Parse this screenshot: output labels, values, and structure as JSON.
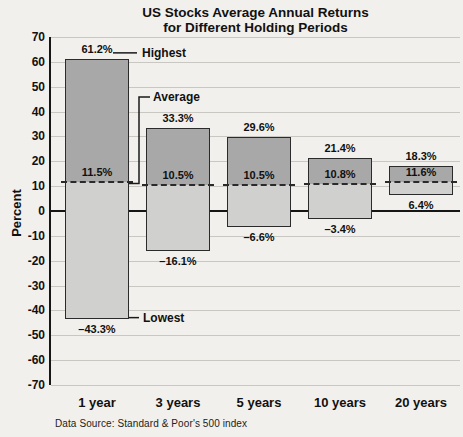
{
  "title": {
    "line1": "US Stocks Average Annual Returns",
    "line2": "for Different Holding Periods"
  },
  "source": "Data Source: Standard & Poor's 500 index",
  "annotations": {
    "highest": "Highest",
    "average": "Average",
    "lowest": "Lowest"
  },
  "colors": {
    "background": "#f2f0ec",
    "bar_above_average": "#a8a8a8",
    "bar_below_average": "#d0d0ce",
    "bar_border": "#2b2b2b",
    "gridline": "#c9c7c2",
    "axis": "#161616",
    "text": "#111111"
  },
  "chart_data": {
    "type": "bar",
    "title": "US Stocks Average Annual Returns for Different Holding Periods",
    "xlabel": "",
    "ylabel": "Percent",
    "ylim": [
      -70,
      70
    ],
    "ytick_step": 10,
    "yticks": [
      70,
      60,
      50,
      40,
      30,
      20,
      10,
      0,
      -10,
      -20,
      -30,
      -40,
      -50,
      -60,
      -70
    ],
    "grid": true,
    "legend": "none",
    "categories": [
      "1 year",
      "3 years",
      "5 years",
      "10 years",
      "20 years"
    ],
    "series": [
      {
        "name": "Highest",
        "values": [
          61.2,
          33.3,
          29.6,
          21.4,
          18.3
        ],
        "labels": [
          "61.2%",
          "33.3%",
          "29.6%",
          "21.4%",
          "18.3%"
        ]
      },
      {
        "name": "Average",
        "values": [
          11.5,
          10.5,
          10.5,
          10.8,
          11.6
        ],
        "labels": [
          "11.5%",
          "10.5%",
          "10.5%",
          "10.8%",
          "11.6%"
        ]
      },
      {
        "name": "Lowest",
        "values": [
          -43.3,
          -16.1,
          -6.6,
          -3.4,
          6.4
        ],
        "labels": [
          "–43.3%",
          "–16.1%",
          "–6.6%",
          "–3.4%",
          "6.4%"
        ]
      }
    ]
  }
}
